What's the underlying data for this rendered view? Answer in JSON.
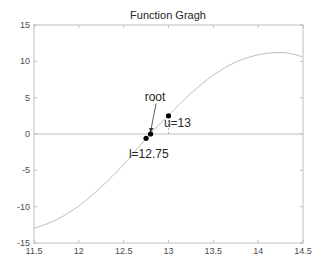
{
  "chart_data": {
    "type": "line",
    "title": "Function Gragh",
    "xlabel": "",
    "ylabel": "",
    "xlim": [
      11.5,
      14.5
    ],
    "ylim": [
      -15,
      15
    ],
    "xticks": [
      11.5,
      12,
      12.5,
      13,
      13.5,
      14,
      14.5
    ],
    "yticks": [
      -15,
      -10,
      -5,
      0,
      5,
      10,
      15
    ],
    "xtick_labels": [
      "11.5",
      "12",
      "12.5",
      "13",
      "13.5",
      "14",
      "14.5"
    ],
    "ytick_labels": [
      "-15",
      "-10",
      "-5",
      "0",
      "5",
      "10",
      "15"
    ],
    "grid": false,
    "series": [
      {
        "name": "f(x)",
        "color": "#b4b4b4",
        "x": [
          11.5,
          11.75,
          12.0,
          12.25,
          12.5,
          12.75,
          13.0,
          13.25,
          13.5,
          13.75,
          14.0,
          14.2,
          14.35,
          14.5
        ],
        "y": [
          -13.0,
          -11.8,
          -9.9,
          -7.3,
          -4.2,
          -0.6,
          2.6,
          5.6,
          8.1,
          9.9,
          10.9,
          11.2,
          11.1,
          10.6
        ]
      },
      {
        "name": "zero-line",
        "color": "#b4b4b4",
        "x": [
          11.5,
          14.5
        ],
        "y": [
          0,
          0
        ]
      }
    ],
    "points": [
      {
        "name": "l",
        "x": 12.75,
        "y": -0.6,
        "color": "#000000"
      },
      {
        "name": "root",
        "x": 12.8,
        "y": 0.0,
        "color": "#000000"
      },
      {
        "name": "u",
        "x": 13.0,
        "y": 2.5,
        "color": "#000000"
      }
    ],
    "annotations": [
      {
        "text": "root",
        "x": 12.85,
        "y": 4.6,
        "arrow_to": [
          12.8,
          0.3
        ]
      },
      {
        "text": "u=13",
        "x": 13.1,
        "y": 1.0
      },
      {
        "text": "l=12.75",
        "x": 12.78,
        "y": -3.3
      }
    ],
    "dashed_guides": [
      {
        "x": 13.0,
        "y_from": 0,
        "y_to": 2.5,
        "color": "#b4b4b4"
      }
    ]
  }
}
